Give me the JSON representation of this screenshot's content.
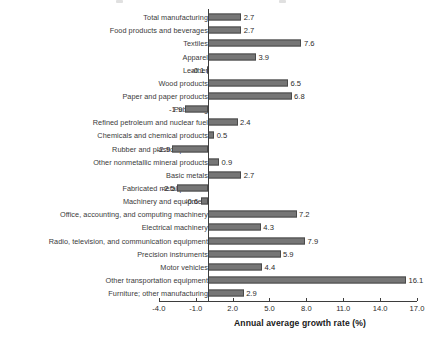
{
  "chart_data": {
    "type": "bar",
    "orientation": "horizontal",
    "title": "",
    "xlabel": "Annual average growth rate (%)",
    "ylabel": "",
    "xlim": [
      -4.0,
      17.0
    ],
    "xticks": [
      "-4.0",
      "-1.0",
      "2.0",
      "5.0",
      "8.0",
      "11.0",
      "14.0",
      "17.0"
    ],
    "xtick_values": [
      -4.0,
      -1.0,
      2.0,
      5.0,
      8.0,
      11.0,
      14.0,
      17.0
    ],
    "grid": false,
    "legend": false,
    "bar_color": "#767676",
    "bar_edge_color": "#4a4a4a",
    "categories": [
      "Total manufacturing",
      "Food products and beverages",
      "Textiles",
      "Apparel",
      "Leather",
      "Wood products",
      "Paper and paper products",
      "Publishing",
      "Refined petroleum and nuclear fuel",
      "Chemicals and chemical products",
      "Rubber and plastics products",
      "Other nonmetallic mineral products",
      "Basic metals",
      "Fabricated metal products",
      "Machinery and equipment",
      "Office, accounting, and computing machinery",
      "Electrical machinery",
      "Radio, television, and communication equipment",
      "Precision instruments",
      "Motor vehicles",
      "Other transportation equipment",
      "Furniture; other manufacturing"
    ],
    "values": [
      2.7,
      2.7,
      7.6,
      3.9,
      -0.1,
      6.5,
      6.8,
      -1.9,
      2.4,
      0.5,
      -2.9,
      0.9,
      2.7,
      -2.5,
      -0.6,
      7.2,
      4.3,
      7.9,
      5.9,
      4.4,
      16.1,
      2.9
    ],
    "value_labels": [
      "2.7",
      "2.7",
      "7.6",
      "3.9",
      "-0.1",
      "6.5",
      "6.8",
      "-1.9",
      "2.4",
      "0.5",
      "-2.9",
      "0.9",
      "2.7",
      "-2.5",
      "-0.6",
      "7.2",
      "4.3",
      "7.9",
      "5.9",
      "4.4",
      "16.1",
      "2.9"
    ]
  }
}
